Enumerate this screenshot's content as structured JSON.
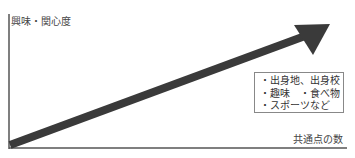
{
  "top_text": "",
  "axes": {
    "y_label": "興味・関心度",
    "x_label": "共通点の数"
  },
  "legend": {
    "items": [
      "・出身地、出身校",
      "・趣味　・食べ物",
      "・スポーツなど"
    ]
  },
  "colors": {
    "axis": "#555555",
    "arrow": "#3a3a3a",
    "box_border": "#888888",
    "text": "#333333"
  }
}
